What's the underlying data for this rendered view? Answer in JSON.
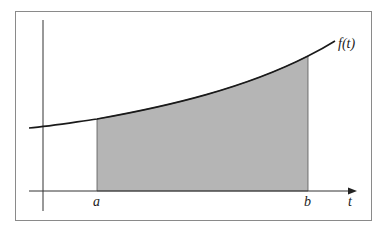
{
  "diagram": {
    "title": "",
    "curve_label": "f(t)",
    "lower_bound_label": "a",
    "upper_bound_label": "b",
    "x_axis_label": "t",
    "colors": {
      "frame": "#8a8a8a",
      "axes": "#333333",
      "curve": "#1a1a1a",
      "shaded_region": "#b5b5b5",
      "background": "#ffffff"
    }
  }
}
